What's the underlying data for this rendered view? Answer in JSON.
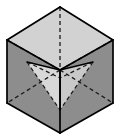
{
  "figure": {
    "type": "line-diagram",
    "canvas": {
      "width": 120,
      "height": 140,
      "background": "#ffffff"
    },
    "colors": {
      "top_face": "#d2d2d2",
      "left_face": "#8d8d8d",
      "right_face": "#8d8d8d",
      "inner_pyramid_light": "#d8d8d8",
      "inner_pyramid_mid": "#c4c4c4",
      "outline": "#000000",
      "hidden_line": "#1a1a1a",
      "background": "#ffffff"
    },
    "stroke": {
      "outline_width": 1.6,
      "hidden_width": 1.3,
      "solid_inner_width": 1.5,
      "dash_pattern": "4 3"
    },
    "vertices": {
      "top_apex": {
        "x": 60,
        "y": 7,
        "label": "top-back-corner"
      },
      "top_left": {
        "x": 7,
        "y": 40,
        "label": "top-left-corner"
      },
      "top_right": {
        "x": 113,
        "y": 40,
        "label": "top-right-corner"
      },
      "top_front": {
        "x": 60,
        "y": 70,
        "label": "top-front-corner"
      },
      "bottom_left": {
        "x": 7,
        "y": 103,
        "label": "bottom-left-corner"
      },
      "bottom_right": {
        "x": 113,
        "y": 103,
        "label": "bottom-right-corner"
      },
      "bottom_front": {
        "x": 60,
        "y": 133,
        "label": "bottom-front-corner"
      },
      "bottom_back": {
        "x": 60,
        "y": 70,
        "label": "bottom-back-corner-hidden"
      }
    },
    "faces": [
      {
        "name": "top-face",
        "points": "60,7 113,40 60,70 7,40",
        "fill": "#d2d2d2"
      },
      {
        "name": "left-face",
        "points": "7,40 60,70 60,133 7,103",
        "fill": "#8d8d8d"
      },
      {
        "name": "right-face",
        "points": "60,70 113,40 113,103 60,133",
        "fill": "#8d8d8d"
      }
    ],
    "inner_pyramid": {
      "apex": {
        "x": 60,
        "y": 70
      },
      "tip": {
        "x": 60,
        "y": 110
      },
      "base_left": {
        "x": 27,
        "y": 62
      },
      "base_right": {
        "x": 93,
        "y": 62
      },
      "faces": [
        {
          "name": "pyramid-left-face",
          "points": "27,62 60,70 60,110",
          "fill": "#d8d8d8"
        },
        {
          "name": "pyramid-right-face",
          "points": "93,62 60,70 60,110",
          "fill": "#c9c9c9"
        }
      ]
    },
    "edges_solid": [
      {
        "name": "edge-top-apex-to-top-left",
        "x1": 60,
        "y1": 7,
        "x2": 7,
        "y2": 40
      },
      {
        "name": "edge-top-apex-to-top-right",
        "x1": 60,
        "y1": 7,
        "x2": 113,
        "y2": 40
      },
      {
        "name": "edge-top-left-to-top-front",
        "x1": 7,
        "y1": 40,
        "x2": 60,
        "y2": 70
      },
      {
        "name": "edge-top-right-to-top-front",
        "x1": 113,
        "y1": 40,
        "x2": 60,
        "y2": 70
      },
      {
        "name": "edge-left-vertical",
        "x1": 7,
        "y1": 40,
        "x2": 7,
        "y2": 103
      },
      {
        "name": "edge-right-vertical",
        "x1": 113,
        "y1": 40,
        "x2": 113,
        "y2": 103
      },
      {
        "name": "edge-front-vertical",
        "x1": 60,
        "y1": 70,
        "x2": 60,
        "y2": 133
      },
      {
        "name": "edge-bottom-left-to-front",
        "x1": 7,
        "y1": 103,
        "x2": 60,
        "y2": 133
      },
      {
        "name": "edge-bottom-right-to-front",
        "x1": 113,
        "y1": 103,
        "x2": 60,
        "y2": 133
      }
    ],
    "edges_dashed": [
      {
        "name": "hidden-edge-vertical-back",
        "x1": 60,
        "y1": 7,
        "x2": 60,
        "y2": 70
      },
      {
        "name": "hidden-edge-back-to-top-left",
        "x1": 60,
        "y1": 70,
        "x2": 7,
        "y2": 40
      },
      {
        "name": "hidden-edge-back-to-top-right",
        "x1": 60,
        "y1": 70,
        "x2": 113,
        "y2": 40
      },
      {
        "name": "hidden-edge-bottom-back-to-bottom-left",
        "x1": 60,
        "y1": 70,
        "x2": 7,
        "y2": 103
      },
      {
        "name": "hidden-edge-bottom-back-to-bottom-right",
        "x1": 60,
        "y1": 70,
        "x2": 113,
        "y2": 103
      }
    ],
    "pyramid_edges_solid": [
      {
        "name": "pyramid-edge-left-upper",
        "x1": 27,
        "y1": 62,
        "x2": 60,
        "y2": 70
      },
      {
        "name": "pyramid-edge-right-upper",
        "x1": 93,
        "y1": 62,
        "x2": 60,
        "y2": 70
      },
      {
        "name": "pyramid-edge-center-axis",
        "x1": 60,
        "y1": 70,
        "x2": 60,
        "y2": 110
      }
    ],
    "pyramid_edges_dashed": [
      {
        "name": "pyramid-hidden-edge-left",
        "x1": 27,
        "y1": 62,
        "x2": 60,
        "y2": 110
      },
      {
        "name": "pyramid-hidden-edge-right",
        "x1": 93,
        "y1": 62,
        "x2": 60,
        "y2": 110
      },
      {
        "name": "pyramid-hidden-base-left",
        "x1": 27,
        "y1": 62,
        "x2": 60,
        "y2": 78
      },
      {
        "name": "pyramid-hidden-base-right",
        "x1": 93,
        "y1": 62,
        "x2": 60,
        "y2": 78
      }
    ]
  }
}
